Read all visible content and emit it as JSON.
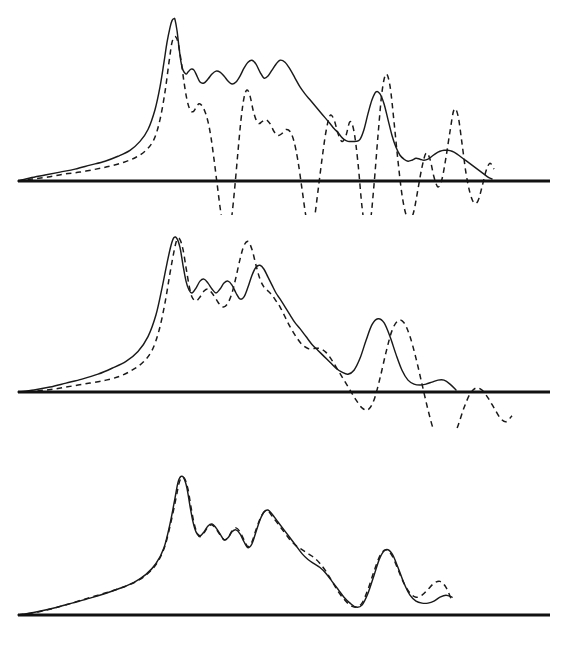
{
  "figure": {
    "title": "",
    "background_color": "#ffffff",
    "ink_color": "#1a1a1a",
    "panel_count": 3,
    "width": 570,
    "height": 645
  },
  "legend": {
    "solid_label": "solid curve",
    "dashed_label": "dashed curve"
  },
  "chart_data": [
    {
      "type": "line",
      "title": "",
      "subtitle": "",
      "xlabel": "",
      "ylabel": "",
      "panel": "top",
      "grid": false,
      "legend_position": "none",
      "xlim": [
        0,
        570
      ],
      "ylim": [
        -60,
        170
      ],
      "baseline_y": 0,
      "baseline_x_range": [
        18,
        550
      ],
      "annotations": [],
      "series": [
        {
          "name": "solid",
          "style": "solid",
          "x": [
            18,
            30,
            45,
            60,
            75,
            90,
            105,
            118,
            130,
            140,
            148,
            155,
            160,
            164,
            167,
            170,
            172,
            174,
            175,
            177,
            179,
            181,
            183,
            186,
            188,
            191,
            194,
            197,
            200,
            204,
            208,
            212,
            216,
            220,
            224,
            228,
            232,
            236,
            240,
            244,
            248,
            252,
            256,
            260,
            264,
            268,
            272,
            276,
            280,
            285,
            290,
            295,
            300,
            305,
            310,
            315,
            320,
            325,
            330,
            334,
            338,
            341,
            344,
            348,
            352,
            356,
            360,
            364,
            368,
            372,
            376,
            380,
            384,
            388,
            392,
            396,
            400,
            404,
            408,
            412,
            416,
            420,
            424,
            428,
            432,
            436,
            440,
            444,
            448,
            452,
            456,
            460,
            464,
            468,
            472,
            476,
            480,
            484,
            488,
            492
          ],
          "y": [
            0,
            3,
            6,
            9,
            12,
            16,
            20,
            25,
            31,
            40,
            52,
            72,
            95,
            120,
            140,
            155,
            162,
            164,
            163,
            152,
            135,
            120,
            112,
            108,
            110,
            113,
            112,
            106,
            100,
            99,
            103,
            108,
            111,
            110,
            106,
            101,
            98,
            100,
            106,
            114,
            120,
            122,
            118,
            110,
            104,
            106,
            112,
            118,
            122,
            120,
            113,
            104,
            95,
            88,
            82,
            76,
            70,
            64,
            58,
            53,
            49,
            45,
            42,
            40,
            40,
            40,
            42,
            52,
            68,
            82,
            90,
            88,
            78,
            62,
            46,
            34,
            26,
            22,
            20,
            21,
            23,
            22,
            21,
            22,
            25,
            28,
            30,
            31,
            31,
            30,
            28,
            25,
            22,
            19,
            16,
            13,
            10,
            7,
            4,
            2
          ]
        },
        {
          "name": "dashed",
          "style": "dashed",
          "x": [
            18,
            32,
            48,
            64,
            80,
            96,
            110,
            124,
            136,
            146,
            154,
            160,
            165,
            169,
            172,
            175,
            178,
            181,
            184,
            187,
            190,
            193,
            196,
            199,
            202,
            205,
            208,
            211,
            214,
            217,
            220,
            223,
            226,
            229,
            232,
            235,
            238,
            241,
            244,
            247,
            250,
            253,
            256,
            259,
            262,
            266,
            270,
            274,
            278,
            282,
            286,
            290,
            294,
            298,
            302,
            306,
            310,
            314,
            318,
            322,
            326,
            330,
            334,
            338,
            342,
            346,
            350,
            354,
            358,
            362,
            366,
            370,
            374,
            378,
            382,
            386,
            390,
            394,
            398,
            402,
            406,
            410,
            414,
            418,
            422,
            426,
            430,
            434,
            438,
            442,
            446,
            450,
            454,
            458,
            462,
            466,
            470,
            474,
            478,
            482,
            486,
            490,
            494
          ],
          "y": [
            0,
            2,
            4,
            7,
            9,
            12,
            15,
            19,
            24,
            31,
            42,
            62,
            90,
            120,
            140,
            146,
            140,
            122,
            100,
            82,
            72,
            70,
            74,
            78,
            76,
            70,
            60,
            44,
            22,
            -2,
            -26,
            -46,
            -58,
            -55,
            -34,
            -4,
            30,
            62,
            84,
            92,
            86,
            72,
            62,
            58,
            60,
            62,
            58,
            50,
            46,
            48,
            52,
            50,
            40,
            20,
            -8,
            -36,
            -50,
            -40,
            -10,
            22,
            50,
            66,
            62,
            48,
            40,
            46,
            60,
            50,
            18,
            -26,
            -52,
            -44,
            -4,
            46,
            90,
            108,
            96,
            60,
            20,
            -14,
            -34,
            -40,
            -30,
            -8,
            14,
            28,
            22,
            4,
            -6,
            2,
            24,
            50,
            72,
            66,
            38,
            8,
            -12,
            -22,
            -20,
            -6,
            10,
            18,
            12
          ]
        }
      ]
    },
    {
      "type": "line",
      "title": "",
      "subtitle": "",
      "xlabel": "",
      "ylabel": "",
      "panel": "middle",
      "grid": false,
      "legend_position": "none",
      "xlim": [
        0,
        570
      ],
      "ylim": [
        -60,
        170
      ],
      "baseline_y": 0,
      "baseline_x_range": [
        18,
        550
      ],
      "annotations": [],
      "series": [
        {
          "name": "solid",
          "style": "solid",
          "x": [
            18,
            34,
            50,
            66,
            82,
            98,
            112,
            126,
            138,
            148,
            156,
            162,
            167,
            171,
            174,
            177,
            180,
            183,
            186,
            189,
            192,
            196,
            200,
            204,
            208,
            212,
            216,
            220,
            224,
            228,
            232,
            236,
            240,
            244,
            248,
            252,
            256,
            260,
            264,
            268,
            272,
            276,
            280,
            285,
            290,
            295,
            300,
            306,
            312,
            318,
            324,
            330,
            336,
            342,
            348,
            354,
            360,
            366,
            372,
            378,
            384,
            390,
            396,
            402,
            408,
            414,
            420,
            426,
            432,
            438,
            444,
            450,
            456
          ],
          "y": [
            0,
            2,
            5,
            9,
            13,
            18,
            24,
            31,
            41,
            56,
            78,
            105,
            130,
            148,
            156,
            155,
            146,
            128,
            112,
            103,
            100,
            105,
            112,
            114,
            110,
            104,
            100,
            104,
            110,
            112,
            108,
            100,
            94,
            96,
            106,
            118,
            126,
            128,
            124,
            116,
            108,
            100,
            94,
            86,
            78,
            70,
            64,
            56,
            48,
            42,
            36,
            30,
            24,
            20,
            18,
            22,
            34,
            52,
            68,
            74,
            70,
            56,
            38,
            22,
            12,
            8,
            7,
            8,
            10,
            12,
            12,
            8,
            2
          ]
        },
        {
          "name": "dashed",
          "style": "dashed",
          "x": [
            18,
            36,
            54,
            72,
            90,
            106,
            120,
            132,
            143,
            152,
            159,
            165,
            170,
            174,
            177,
            180,
            183,
            186,
            189,
            192,
            196,
            200,
            204,
            208,
            212,
            216,
            220,
            224,
            228,
            232,
            236,
            240,
            244,
            248,
            252,
            256,
            260,
            264,
            268,
            272,
            276,
            280,
            285,
            290,
            296,
            302,
            308,
            314,
            320,
            326,
            332,
            338,
            344,
            350,
            356,
            362,
            368,
            374,
            380,
            386,
            392,
            398,
            404,
            410,
            416,
            422,
            428,
            434,
            440,
            446,
            452,
            458,
            464,
            470,
            476,
            482,
            488,
            494,
            500,
            506,
            512
          ],
          "y": [
            0,
            1,
            3,
            6,
            9,
            12,
            16,
            22,
            30,
            42,
            62,
            90,
            120,
            142,
            154,
            154,
            144,
            126,
            108,
            96,
            92,
            96,
            102,
            104,
            100,
            94,
            88,
            86,
            90,
            100,
            116,
            134,
            148,
            152,
            144,
            128,
            114,
            106,
            102,
            98,
            92,
            86,
            76,
            66,
            56,
            48,
            44,
            44,
            44,
            40,
            32,
            22,
            12,
            2,
            -8,
            -16,
            -18,
            -8,
            14,
            40,
            62,
            72,
            70,
            56,
            34,
            8,
            -18,
            -40,
            -54,
            -58,
            -50,
            -34,
            -16,
            -2,
            4,
            2,
            -6,
            -16,
            -26,
            -30,
            -24
          ]
        }
      ]
    },
    {
      "type": "line",
      "title": "",
      "subtitle": "",
      "xlabel": "",
      "ylabel": "",
      "panel": "bottom",
      "grid": false,
      "legend_position": "none",
      "xlim": [
        0,
        570
      ],
      "ylim": [
        -30,
        170
      ],
      "baseline_y": 0,
      "baseline_x_range": [
        18,
        550
      ],
      "annotations": [],
      "series": [
        {
          "name": "solid",
          "style": "solid",
          "x": [
            18,
            36,
            54,
            72,
            90,
            106,
            120,
            134,
            146,
            156,
            164,
            170,
            175,
            178,
            181,
            184,
            187,
            190,
            193,
            196,
            200,
            204,
            208,
            212,
            216,
            220,
            224,
            228,
            232,
            236,
            240,
            244,
            248,
            252,
            256,
            260,
            264,
            268,
            272,
            278,
            284,
            290,
            296,
            302,
            308,
            314,
            320,
            326,
            332,
            338,
            344,
            350,
            356,
            362,
            368,
            374,
            380,
            386,
            392,
            398,
            404,
            410,
            416,
            422,
            428,
            434,
            440,
            446,
            452
          ],
          "y": [
            0,
            3,
            7,
            12,
            17,
            22,
            27,
            33,
            41,
            52,
            68,
            92,
            118,
            134,
            140,
            138,
            128,
            110,
            94,
            84,
            80,
            84,
            90,
            92,
            88,
            82,
            76,
            78,
            84,
            86,
            82,
            74,
            68,
            72,
            84,
            96,
            104,
            106,
            102,
            94,
            86,
            78,
            70,
            62,
            56,
            52,
            48,
            42,
            34,
            26,
            18,
            12,
            8,
            10,
            22,
            40,
            58,
            66,
            62,
            48,
            32,
            20,
            14,
            12,
            12,
            14,
            18,
            20,
            18,
            12,
            4
          ]
        },
        {
          "name": "dashed",
          "style": "dashed",
          "x": [
            18,
            38,
            58,
            78,
            98,
            114,
            128,
            140,
            150,
            158,
            165,
            171,
            176,
            179,
            182,
            185,
            188,
            191,
            194,
            197,
            200,
            204,
            208,
            212,
            216,
            220,
            224,
            228,
            232,
            236,
            240,
            244,
            248,
            252,
            256,
            260,
            264,
            268,
            272,
            278,
            284,
            290,
            296,
            302,
            308,
            314,
            320,
            326,
            332,
            338,
            344,
            350,
            356,
            362,
            368,
            374,
            380,
            386,
            392,
            398,
            404,
            410,
            416,
            422,
            428,
            434,
            440,
            446,
            452
          ],
          "y": [
            0,
            3,
            8,
            14,
            20,
            25,
            30,
            36,
            44,
            54,
            70,
            94,
            118,
            133,
            139,
            137,
            127,
            109,
            93,
            83,
            79,
            83,
            89,
            91,
            87,
            81,
            76,
            78,
            85,
            88,
            84,
            76,
            69,
            74,
            86,
            97,
            104,
            105,
            100,
            92,
            84,
            76,
            70,
            66,
            62,
            58,
            52,
            44,
            34,
            24,
            16,
            10,
            8,
            12,
            26,
            44,
            60,
            66,
            60,
            46,
            32,
            22,
            18,
            20,
            26,
            32,
            34,
            28,
            14
          ]
        }
      ]
    }
  ]
}
